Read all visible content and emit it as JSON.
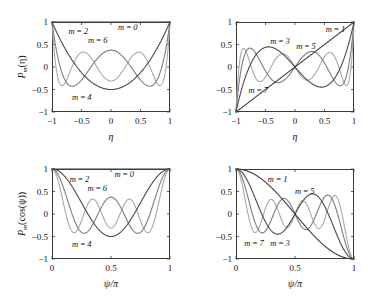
{
  "figure": {
    "background": "#ffffff",
    "panel_border_color": "#3a3a3a"
  },
  "colors": {
    "dark": "#4a4a4a",
    "mid": "#7d7d7d",
    "light": "#a9a9a9",
    "darkest": "#3c3c3c"
  },
  "chart_data": [
    {
      "id": "top-left",
      "type": "line",
      "title": "",
      "xlabel": "η",
      "ylabel": "P_m(η)",
      "xlim": [
        -1,
        1
      ],
      "ylim": [
        -1,
        1
      ],
      "xticks": [
        -1,
        -0.5,
        0,
        0.5,
        1
      ],
      "xticklabels": [
        "−1",
        "−0.5",
        "0",
        "0.5",
        "1"
      ],
      "yticks": [
        -1,
        -0.5,
        0,
        0.5,
        1
      ],
      "yticklabels": [
        "−1",
        "−0.5",
        "0",
        "0.5",
        "1"
      ],
      "grid": false,
      "legend": "inline-annotations",
      "function": "legendre",
      "variable": "eta",
      "series": [
        {
          "name": "m=0",
          "order": 0,
          "color": "darkest",
          "label": "m = 0",
          "label_pos": {
            "x": 0.12,
            "y": 0.88
          }
        },
        {
          "name": "m=2",
          "order": 2,
          "color": "dark",
          "label": "m = 2",
          "label_pos": {
            "x": -0.72,
            "y": 0.79
          }
        },
        {
          "name": "m=4",
          "order": 4,
          "color": "mid",
          "label": "m = 4",
          "label_pos": {
            "x": -0.66,
            "y": -0.66
          }
        },
        {
          "name": "m=6",
          "order": 6,
          "color": "light",
          "label": "m = 6",
          "label_pos": {
            "x": -0.39,
            "y": 0.59
          }
        }
      ]
    },
    {
      "id": "top-right",
      "type": "line",
      "title": "",
      "xlabel": "η",
      "ylabel": "",
      "xlim": [
        -1,
        1
      ],
      "ylim": [
        -1,
        1
      ],
      "xticks": [
        -1,
        -0.5,
        0,
        0.5,
        1
      ],
      "xticklabels": [
        "−1",
        "−0.5",
        "0",
        "0.5",
        "1"
      ],
      "yticks": [
        -1,
        -0.5,
        0,
        0.5,
        1
      ],
      "yticklabels": [
        "−1",
        "−0.5",
        "0",
        "0.5",
        "1"
      ],
      "grid": false,
      "legend": "inline-annotations",
      "function": "legendre",
      "variable": "eta",
      "series": [
        {
          "name": "m=1",
          "order": 1,
          "color": "darkest",
          "label": "m = 1",
          "label_pos": {
            "x": 0.52,
            "y": 0.84
          }
        },
        {
          "name": "m=3",
          "order": 3,
          "color": "dark",
          "label": "m = 3",
          "label_pos": {
            "x": -0.42,
            "y": 0.58
          }
        },
        {
          "name": "m=5",
          "order": 5,
          "color": "mid",
          "label": "m = 5",
          "label_pos": {
            "x": 0.02,
            "y": 0.47
          }
        },
        {
          "name": "m=7",
          "order": 7,
          "color": "light",
          "label": "m = 7",
          "label_pos": {
            "x": -0.79,
            "y": -0.5
          }
        }
      ]
    },
    {
      "id": "bottom-left",
      "type": "line",
      "title": "",
      "xlabel": "ψ/π",
      "ylabel": "P_m(cos(ψ))",
      "xlim": [
        0,
        1
      ],
      "ylim": [
        -1,
        1
      ],
      "xticks": [
        0,
        0.5,
        1
      ],
      "xticklabels": [
        "0",
        "0.5",
        "1"
      ],
      "yticks": [
        -1,
        -0.5,
        0,
        0.5,
        1
      ],
      "yticklabels": [
        "−1",
        "−0.5",
        "0",
        "0.5",
        "1"
      ],
      "grid": false,
      "legend": "inline-annotations",
      "function": "legendre_cos",
      "variable": "psi_over_pi",
      "series": [
        {
          "name": "m=0",
          "order": 0,
          "color": "darkest",
          "label": "m = 0",
          "label_pos": {
            "x": 0.53,
            "y": 0.88
          }
        },
        {
          "name": "m=2",
          "order": 2,
          "color": "dark",
          "label": "m = 2",
          "label_pos": {
            "x": 0.15,
            "y": 0.78
          }
        },
        {
          "name": "m=4",
          "order": 4,
          "color": "mid",
          "label": "m = 4",
          "label_pos": {
            "x": 0.17,
            "y": -0.66
          }
        },
        {
          "name": "m=6",
          "order": 6,
          "color": "light",
          "label": "m = 6",
          "label_pos": {
            "x": 0.3,
            "y": 0.58
          }
        }
      ]
    },
    {
      "id": "bottom-right",
      "type": "line",
      "title": "",
      "xlabel": "ψ/π",
      "ylabel": "",
      "xlim": [
        0,
        1
      ],
      "ylim": [
        -1,
        1
      ],
      "xticks": [
        0,
        0.5,
        1
      ],
      "xticklabels": [
        "0",
        "0.5",
        "1"
      ],
      "yticks": [
        -1,
        -0.5,
        0,
        0.5,
        1
      ],
      "yticklabels": [
        "−1",
        "−0.5",
        "0",
        "0.5",
        "1"
      ],
      "grid": false,
      "legend": "inline-annotations",
      "function": "legendre_cos",
      "variable": "psi_over_pi",
      "series": [
        {
          "name": "m=1",
          "order": 1,
          "color": "darkest",
          "label": "m = 1",
          "label_pos": {
            "x": 0.27,
            "y": 0.78
          }
        },
        {
          "name": "m=3",
          "order": 3,
          "color": "dark",
          "label": "m = 3",
          "label_pos": {
            "x": 0.29,
            "y": -0.64
          }
        },
        {
          "name": "m=5",
          "order": 5,
          "color": "mid",
          "label": "m = 5",
          "label_pos": {
            "x": 0.5,
            "y": 0.52
          }
        },
        {
          "name": "m=7",
          "order": 7,
          "color": "light",
          "label": "m = 7",
          "label_pos": {
            "x": 0.07,
            "y": -0.64
          }
        }
      ]
    }
  ]
}
